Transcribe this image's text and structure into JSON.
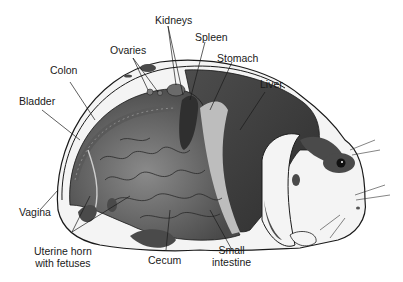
{
  "diagram": {
    "labels": {
      "kidneys": "Kidneys",
      "spleen": "Spleen",
      "ovaries": "Ovaries",
      "stomach": "Stomach",
      "colon": "Colon",
      "liver": "Liver",
      "bladder": "Bladder",
      "vagina": "Vagina",
      "uterine_horn_line1": "Uterine horn",
      "uterine_horn_line2": "with fetuses",
      "cecum": "Cecum",
      "small_intestine_line1": "Small",
      "small_intestine_line2": "intestine"
    },
    "colors": {
      "organ_dark": "#3f3f3f",
      "organ_mid": "#6a6a6a",
      "organ_light": "#9a9a9a",
      "fur_spots": "#4a4a4a",
      "outline": "#1a1a1a",
      "background": "#ffffff"
    }
  }
}
